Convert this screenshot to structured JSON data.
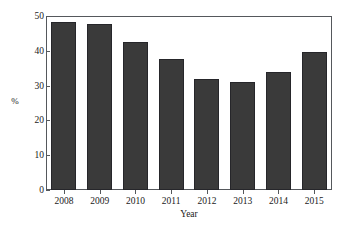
{
  "chart_data": {
    "type": "bar",
    "title": "",
    "subtitle": "",
    "xlabel": "Year",
    "ylabel": "%",
    "categories": [
      "2008",
      "2009",
      "2010",
      "2011",
      "2012",
      "2013",
      "2014",
      "2015"
    ],
    "values": [
      48.4,
      47.6,
      42.5,
      37.6,
      31.9,
      31.0,
      33.9,
      39.7
    ],
    "series": [
      {
        "name": "",
        "values": [
          48.4,
          47.6,
          42.5,
          37.6,
          31.9,
          31.0,
          33.9,
          39.7
        ]
      }
    ],
    "ylim": [
      0,
      50
    ],
    "ytick_labels": [
      "0",
      "10",
      "20",
      "30",
      "40",
      "50"
    ],
    "ytick_values": [
      0,
      10,
      20,
      30,
      40,
      50
    ],
    "grid": false,
    "legend": "none",
    "bar_color": "#3a3a3a",
    "bar_edge_color": "#26262a",
    "axis_color": "#55585c",
    "background_color": "#ffffff",
    "text_color": "#1a1a1a"
  }
}
